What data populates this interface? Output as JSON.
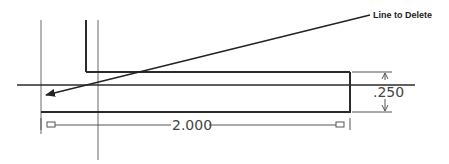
{
  "diagram": {
    "type": "cad-sketch",
    "annotation": {
      "label": "Line to Delete",
      "icon": "leader-arrow-icon"
    },
    "dimensions": {
      "length": "2.000",
      "thickness": ".250"
    },
    "colors": {
      "geometry": "#2b2b2b",
      "construction": "#6a6a6a",
      "dimension": "#555555",
      "text": "#222222"
    }
  }
}
